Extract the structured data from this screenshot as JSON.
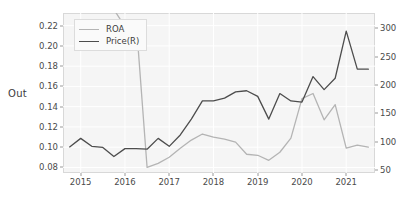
{
  "figure": {
    "ylabel_left_text": "Out"
  },
  "legend": {
    "entries": [
      {
        "label": "ROA",
        "color": "#b4b4b4"
      },
      {
        "label": "Price(R)",
        "color": "#4d4d4d"
      }
    ]
  },
  "chart_data": {
    "type": "line",
    "title": "",
    "xlabel": "",
    "ylabel": "Out",
    "grid": true,
    "legend_position": "upper-left",
    "xlim": [
      2014.6,
      2021.65
    ],
    "xticks": [
      2015,
      2016,
      2017,
      2018,
      2019,
      2020,
      2021
    ],
    "xticklabels": [
      "2015",
      "2016",
      "2017",
      "2018",
      "2019",
      "2020",
      "2021"
    ],
    "ylim_left": [
      0.0745,
      0.2325
    ],
    "yticks_left": [
      0.08,
      0.1,
      0.12,
      0.14,
      0.16,
      0.18,
      0.2,
      0.22
    ],
    "yticklabels_left": [
      "0.08",
      "0.10",
      "0.12",
      "0.14",
      "0.16",
      "0.18",
      "0.20",
      "0.22"
    ],
    "ylim_right": [
      45,
      327
    ],
    "yticks_right": [
      50,
      100,
      150,
      200,
      250,
      300
    ],
    "yticklabels_right": [
      "50",
      "100",
      "150",
      "200",
      "250",
      "300"
    ],
    "series": [
      {
        "name": "ROA",
        "axis": "left",
        "color": "#b4b4b4",
        "x": [
          2014.75,
          2015.0,
          2015.25,
          2015.5,
          2015.75,
          2016.0,
          2016.25,
          2016.5,
          2016.75,
          2017.0,
          2017.25,
          2017.5,
          2017.75,
          2018.0,
          2018.25,
          2018.5,
          2018.75,
          2019.0,
          2019.25,
          2019.5,
          2019.75,
          2020.0,
          2020.25,
          2020.5,
          2020.75,
          2021.0,
          2021.25,
          2021.5
        ],
        "values": [
          0.238,
          0.241,
          0.24,
          0.238,
          0.236,
          0.219,
          0.226,
          0.08,
          0.084,
          0.09,
          0.099,
          0.107,
          0.113,
          0.11,
          0.108,
          0.105,
          0.093,
          0.092,
          0.087,
          0.095,
          0.109,
          0.148,
          0.153,
          0.127,
          0.142,
          0.099,
          0.102,
          0.1
        ]
      },
      {
        "name": "Price(R)",
        "axis": "right",
        "color": "#4d4d4d",
        "x": [
          2014.75,
          2015.0,
          2015.25,
          2015.5,
          2015.75,
          2016.0,
          2016.25,
          2016.5,
          2016.75,
          2017.0,
          2017.25,
          2017.5,
          2017.75,
          2018.0,
          2018.25,
          2018.5,
          2018.75,
          2019.0,
          2019.25,
          2019.5,
          2019.75,
          2020.0,
          2020.25,
          2020.5,
          2020.75,
          2021.0,
          2021.25,
          2021.5
        ],
        "values_right": [
          91,
          106,
          92,
          90,
          74,
          88,
          88,
          87,
          106,
          92,
          112,
          140,
          172,
          172,
          177,
          188,
          190,
          180,
          140,
          185,
          172,
          170,
          215,
          192,
          212,
          295,
          228,
          228
        ]
      }
    ]
  }
}
